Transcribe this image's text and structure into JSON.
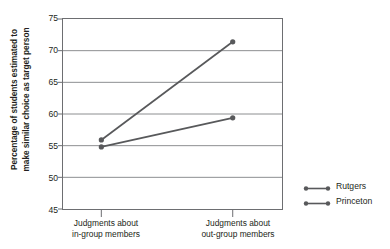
{
  "chart_data": {
    "type": "line",
    "title": "",
    "xlabel": "",
    "ylabel": "Percentage of students estimated to make similar choice as target person",
    "ylabel_lines": [
      "Percentage of students estimated to",
      "make similar choice as target person"
    ],
    "categories": [
      "Judgments about in-group members",
      "Judgments about out-group members"
    ],
    "category_lines": [
      [
        "Judgments about",
        "in-group members"
      ],
      [
        "Judgments about",
        "out-group members"
      ]
    ],
    "series": [
      {
        "name": "Rutgers",
        "values": [
          55.9,
          71.4
        ],
        "color": "#58595b"
      },
      {
        "name": "Princeton",
        "values": [
          54.8,
          59.4
        ],
        "color": "#58595b"
      }
    ],
    "ylim": [
      45,
      75
    ],
    "yticks": [
      75,
      70,
      65,
      60,
      55,
      50,
      45
    ],
    "ytick_labels": [
      "75",
      "70",
      "65",
      "60",
      "55",
      "50",
      "45"
    ],
    "grid": true,
    "legend_position": "right",
    "legend": [
      {
        "label": "Rutgers"
      },
      {
        "label": "Princeton"
      }
    ],
    "colors": {
      "line": "#58595b",
      "marker": "#58595b",
      "grid": "#808285",
      "axis": "#6d6e71",
      "text": "#231f20"
    }
  }
}
